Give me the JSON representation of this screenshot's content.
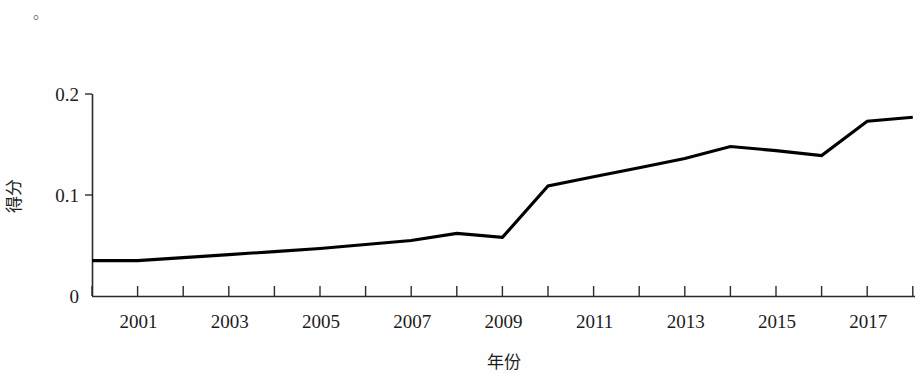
{
  "annotation": {
    "stray_mark": "。"
  },
  "chart_data": {
    "type": "line",
    "title": "",
    "xlabel": "年份",
    "ylabel": "得分",
    "x": [
      2000,
      2001,
      2002,
      2003,
      2004,
      2005,
      2006,
      2007,
      2008,
      2009,
      2010,
      2011,
      2012,
      2013,
      2014,
      2015,
      2016,
      2017,
      2018
    ],
    "values": [
      0.035,
      0.035,
      0.038,
      0.041,
      0.044,
      0.047,
      0.051,
      0.055,
      0.062,
      0.058,
      0.109,
      0.118,
      0.127,
      0.136,
      0.148,
      0.144,
      0.139,
      0.173,
      0.177
    ],
    "series": [
      {
        "name": "得分",
        "values": [
          0.035,
          0.035,
          0.038,
          0.041,
          0.044,
          0.047,
          0.051,
          0.055,
          0.062,
          0.058,
          0.109,
          0.118,
          0.127,
          0.136,
          0.148,
          0.144,
          0.139,
          0.173,
          0.177
        ]
      }
    ],
    "xlim": [
      2000,
      2018.4
    ],
    "ylim": [
      0,
      0.2
    ],
    "y_ticks": [
      "0",
      "0.1",
      "0.2"
    ],
    "y_tick_values": [
      0,
      0.1,
      0.2
    ],
    "x_ticks": [
      2000,
      2001,
      2002,
      2003,
      2004,
      2005,
      2006,
      2007,
      2008,
      2009,
      2010,
      2011,
      2012,
      2013,
      2014,
      2015,
      2016,
      2017,
      2018
    ],
    "x_tick_labels": [
      "2001",
      "2003",
      "2005",
      "2007",
      "2009",
      "2011",
      "2013",
      "2015",
      "2017"
    ],
    "x_tick_label_values": [
      2001,
      2003,
      2005,
      2007,
      2009,
      2011,
      2013,
      2015,
      2017
    ],
    "grid": false,
    "legend": false,
    "line_color": "#000000"
  }
}
